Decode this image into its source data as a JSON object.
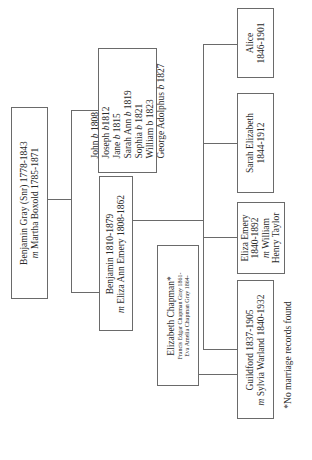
{
  "tree": {
    "root": {
      "line1": "Benjamin Gray (Snr) 1778-1843",
      "line2_prefix": "m",
      "line2": "Martha Boxold 1785-1871"
    },
    "siblings": [
      {
        "name": "John",
        "b": "b",
        "year": "1808"
      },
      {
        "name": "Joseph",
        "b": "b",
        "year": "1812"
      },
      {
        "name": "Jane",
        "b": "b",
        "year": "1815"
      },
      {
        "name": "Sarah Ann",
        "b": "b",
        "year": "1819"
      },
      {
        "name": "Sophia",
        "b": "b",
        "year": "1821"
      },
      {
        "name": "William",
        "b": "b",
        "year": "1823"
      },
      {
        "name": "George Adolphus",
        "b": "b",
        "year": "1827"
      }
    ],
    "parent": {
      "line1": "Benjamin 1810-1879",
      "line2_prefix": "m",
      "line2": "Eliza Ann Emery 1808-1862"
    },
    "elizabeth_chapman": {
      "title": "Elizabeth Chapman*",
      "child1": "Francis Edgar Chapman Gray 1861-",
      "child2": "Eva Amelia Chapman Gray 1864-"
    },
    "children": [
      {
        "line1": "Alice",
        "line2": "1846-1901"
      },
      {
        "line1": "Sarah Elizabeth",
        "line2": "1844-1912"
      },
      {
        "line1": "Eliza Emery",
        "line2": "1840-1892",
        "line3_prefix": "m",
        "line3": "William",
        "line4": "Henry Taylor"
      },
      {
        "line1": "Guildford 1837-1905",
        "line2_prefix": "m",
        "line2": "Sylvia Warland 1840-1932"
      }
    ],
    "footnote": "*No marriage records found"
  }
}
